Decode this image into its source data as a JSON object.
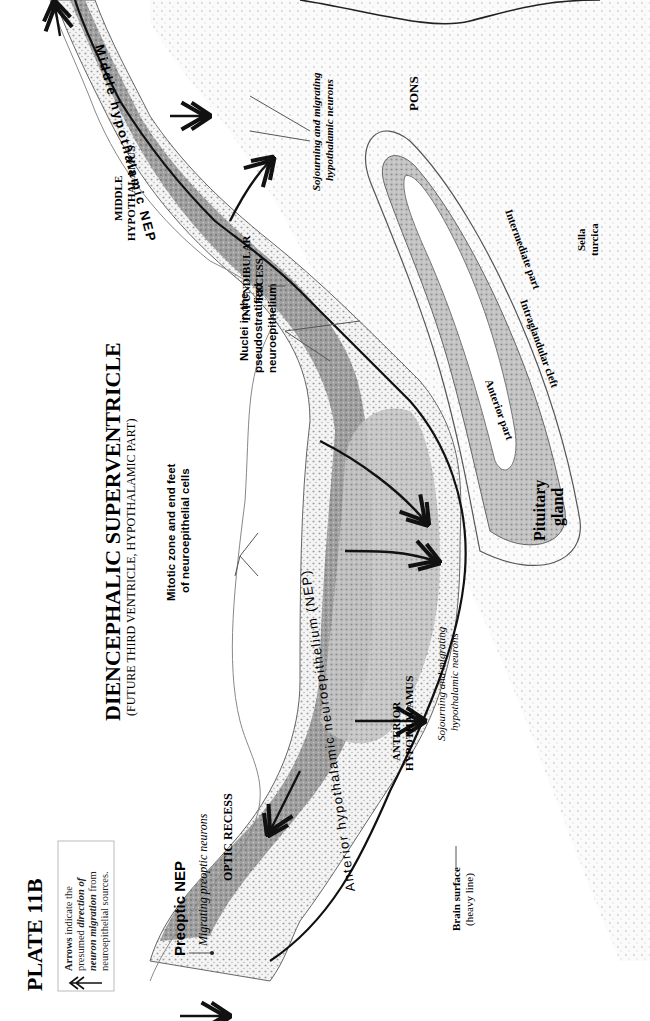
{
  "plate": {
    "title": "PLATE 11B",
    "legend": {
      "line1_a": "Arrows",
      "line1_b": " indicate the",
      "line2_a": "presumed ",
      "line2_b": "direction of",
      "line3_a": "neuron migration",
      "line3_b": " from",
      "line4": "neuroepithelial sources."
    },
    "heading": {
      "title": "DIENCEPHALIC SUPERVENTRICLE",
      "subtitle": "(FUTURE THIRD VENTRICLE, HYPOTHALAMIC PART)"
    }
  },
  "labels": {
    "preoptic_nep": "Preoptic NEP",
    "migrating_preoptic": "Migrating preoptic neurons",
    "optic_recess": "OPTIC RECESS",
    "anterior_hypo_1": "ANTERIOR",
    "anterior_hypo_2": "HYPOTHALAMUS",
    "brain_surface_1": "Brain surface",
    "brain_surface_2": "(heavy line)",
    "mitotic_1": "Mitotic zone and end feet",
    "mitotic_2": "of neuroepithelial cells",
    "sojourn_a_1": "Sojourning and migrating",
    "sojourn_a_2": "hypothalamic neurons",
    "nuclei_1": "Nuclei in the",
    "nuclei_2": "pseudostratified",
    "nuclei_3": "neuroepithelium",
    "infundibular_1": "INFUNDIBULAR",
    "infundibular_2": "RECESS",
    "middle_hypo_1": "MIDDLE",
    "middle_hypo_2": "HYPOTHALAMUS",
    "sojourn_b_1": "Sojourning and migrating",
    "sojourn_b_2": "hypothalamic neurons",
    "pons": "PONS",
    "sella_1": "Sella",
    "sella_2": "turcica",
    "intermediate_part": "Intermediate part",
    "intraglandular_cleft": "Intraglandular cleft",
    "anterior_part": "Anterior part",
    "pituitary_1": "Pituitary",
    "pituitary_2": "gland",
    "anterior_nep_text": "Anterior hypothalamic neuroepithelium (NEP)",
    "middle_nep_text": "Middle hypothalamic NEP"
  },
  "colors": {
    "tissue_dark": "#8a8a8a",
    "tissue_mid": "#b5b5b5",
    "tissue_light": "#dedede",
    "ink": "#111111"
  }
}
